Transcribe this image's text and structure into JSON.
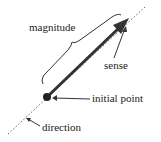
{
  "diagram": {
    "labels": {
      "magnitude": "magnitude",
      "sense": "sense",
      "initial_point": "initial point",
      "direction": "direction"
    },
    "colors": {
      "line": "#333333",
      "text": "#222222"
    }
  }
}
